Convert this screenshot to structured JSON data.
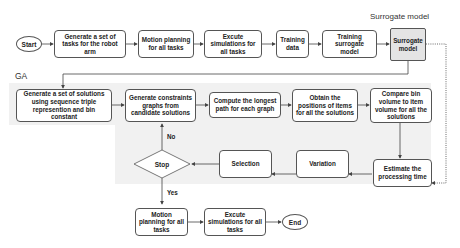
{
  "labels": {
    "surrogate_section": "Surrogate model",
    "ga_section": "GA"
  },
  "top_row": {
    "start": "Start",
    "generate_tasks": "Generate a set of tasks for the robot arm",
    "motion_planning": "Motion planning for all tasks",
    "execute_simulations": "Excute simulations for all tasks",
    "training_data": "Training data",
    "training_surrogate": "Training surrogate model",
    "surrogate_model": "Surrogate model"
  },
  "ga_row1": {
    "generate_solutions": "Generate a set of solutions using sequence triple represention and bin constant",
    "generate_graphs": "Generate constraints graphs from candidate solutions",
    "longest_path": "Compute the longest path for each graph",
    "obtain_positions": "Obtain the positions of items for all the solutions",
    "compare_volume": "Compare bin volume to item volume for all the solutions"
  },
  "ga_row2": {
    "stop": "Stop",
    "selection": "Selection",
    "variation": "Variation",
    "estimate_time": "Estimate the processing time"
  },
  "branches": {
    "no": "No",
    "yes": "Yes"
  },
  "bottom_row": {
    "motion_planning": "Motion planning for all tasks",
    "execute_simulations": "Excute simulations for all tasks",
    "end": "End"
  }
}
